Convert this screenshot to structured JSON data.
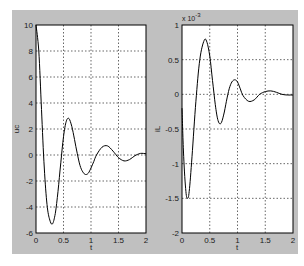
{
  "chart_data": [
    {
      "type": "line",
      "title": "",
      "xlabel": "t",
      "ylabel": "uc",
      "xlim": [
        0,
        2
      ],
      "ylim": [
        -6,
        10
      ],
      "grid": true,
      "xticks": [
        "0",
        "0.5",
        "1",
        "1.5",
        "2"
      ],
      "yticks": [
        "-6",
        "-4",
        "-2",
        "0",
        "2",
        "4",
        "6",
        "8",
        "10"
      ],
      "series": [
        {
          "name": "uc",
          "x": [
            0,
            0.05,
            0.1,
            0.15,
            0.2,
            0.25,
            0.3,
            0.35,
            0.4,
            0.45,
            0.5,
            0.55,
            0.6,
            0.65,
            0.7,
            0.75,
            0.8,
            0.85,
            0.9,
            0.95,
            1.0,
            1.05,
            1.1,
            1.2,
            1.3,
            1.4,
            1.5,
            1.6,
            1.7,
            1.8,
            1.9,
            2.0
          ],
          "y": [
            10,
            8,
            3.5,
            -1,
            -3.8,
            -5.0,
            -5.3,
            -4.5,
            -2.8,
            -0.6,
            1.4,
            2.6,
            2.8,
            2.2,
            1.2,
            0.1,
            -0.8,
            -1.3,
            -1.5,
            -1.4,
            -1.0,
            -0.5,
            0.0,
            0.6,
            0.7,
            0.3,
            -0.2,
            -0.45,
            -0.35,
            -0.05,
            0.12,
            0.1
          ]
        }
      ]
    },
    {
      "type": "line",
      "title": "",
      "xlabel": "t",
      "ylabel": "iL",
      "y_scale_annotation": "x 10^-3",
      "xlim": [
        0,
        2
      ],
      "ylim": [
        -2,
        1
      ],
      "grid": true,
      "xticks": [
        "0",
        "0.5",
        "1",
        "1.5",
        "2"
      ],
      "yticks": [
        "-2",
        "-1.5",
        "-1",
        "-0.5",
        "0",
        "0.5",
        "1"
      ],
      "series": [
        {
          "name": "iL",
          "x": [
            0,
            0.03,
            0.07,
            0.1,
            0.13,
            0.18,
            0.25,
            0.32,
            0.4,
            0.45,
            0.5,
            0.55,
            0.6,
            0.65,
            0.7,
            0.75,
            0.8,
            0.85,
            0.9,
            0.95,
            1.0,
            1.05,
            1.1,
            1.2,
            1.3,
            1.4,
            1.5,
            1.6,
            1.7,
            1.8,
            1.9,
            2.0
          ],
          "y": [
            -0.2,
            -0.9,
            -1.4,
            -1.5,
            -1.4,
            -0.9,
            -0.1,
            0.5,
            0.78,
            0.75,
            0.55,
            0.2,
            -0.15,
            -0.38,
            -0.42,
            -0.3,
            -0.1,
            0.08,
            0.18,
            0.21,
            0.18,
            0.08,
            -0.02,
            -0.1,
            -0.08,
            0.0,
            0.04,
            0.05,
            0.03,
            0.0,
            -0.01,
            -0.01
          ]
        }
      ]
    }
  ],
  "plots": {
    "left": {
      "ylabel": "uc",
      "xlabel": "t",
      "xticks": [
        "0",
        "0.5",
        "1",
        "1.5",
        "2"
      ],
      "yticks": [
        "10",
        "8",
        "6",
        "4",
        "2",
        "0",
        "-2",
        "-4",
        "-6"
      ]
    },
    "right": {
      "ylabel": "iL",
      "xlabel": "t",
      "exponent_base": "x 10",
      "exponent_power": "-3",
      "xticks": [
        "0",
        "0.5",
        "1",
        "1.5",
        "2"
      ],
      "yticks": [
        "1",
        "0.5",
        "0",
        "-0.5",
        "-1",
        "-1.5",
        "-2"
      ]
    }
  },
  "colors": {
    "panel": "#c0c0c0",
    "axes_bg": "#ffffff",
    "line": "#000000",
    "grid": "#000000"
  }
}
